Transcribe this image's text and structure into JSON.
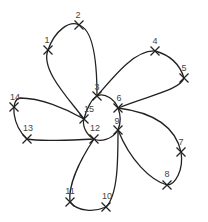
{
  "diagram": {
    "title": "",
    "points": [
      {
        "id": "1",
        "label": "1"
      },
      {
        "id": "2",
        "label": "2"
      },
      {
        "id": "3",
        "label": "3"
      },
      {
        "id": "4",
        "label": "4"
      },
      {
        "id": "5",
        "label": "5"
      },
      {
        "id": "6",
        "label": "6"
      },
      {
        "id": "7",
        "label": "7"
      },
      {
        "id": "8",
        "label": "8"
      },
      {
        "id": "9",
        "label": "9"
      },
      {
        "id": "10",
        "label": "10"
      },
      {
        "id": "11",
        "label": "11"
      },
      {
        "id": "12",
        "label": "12"
      },
      {
        "id": "13",
        "label": "13"
      },
      {
        "id": "14",
        "label": "14"
      },
      {
        "id": "15",
        "label": "15"
      }
    ],
    "path_order": [
      "15",
      "1",
      "2",
      "3",
      "6",
      "4",
      "5",
      "6",
      "9",
      "7",
      "8",
      "9",
      "12",
      "10",
      "11",
      "12",
      "15",
      "14",
      "13",
      "12"
    ],
    "stroke_color": "#222222"
  }
}
